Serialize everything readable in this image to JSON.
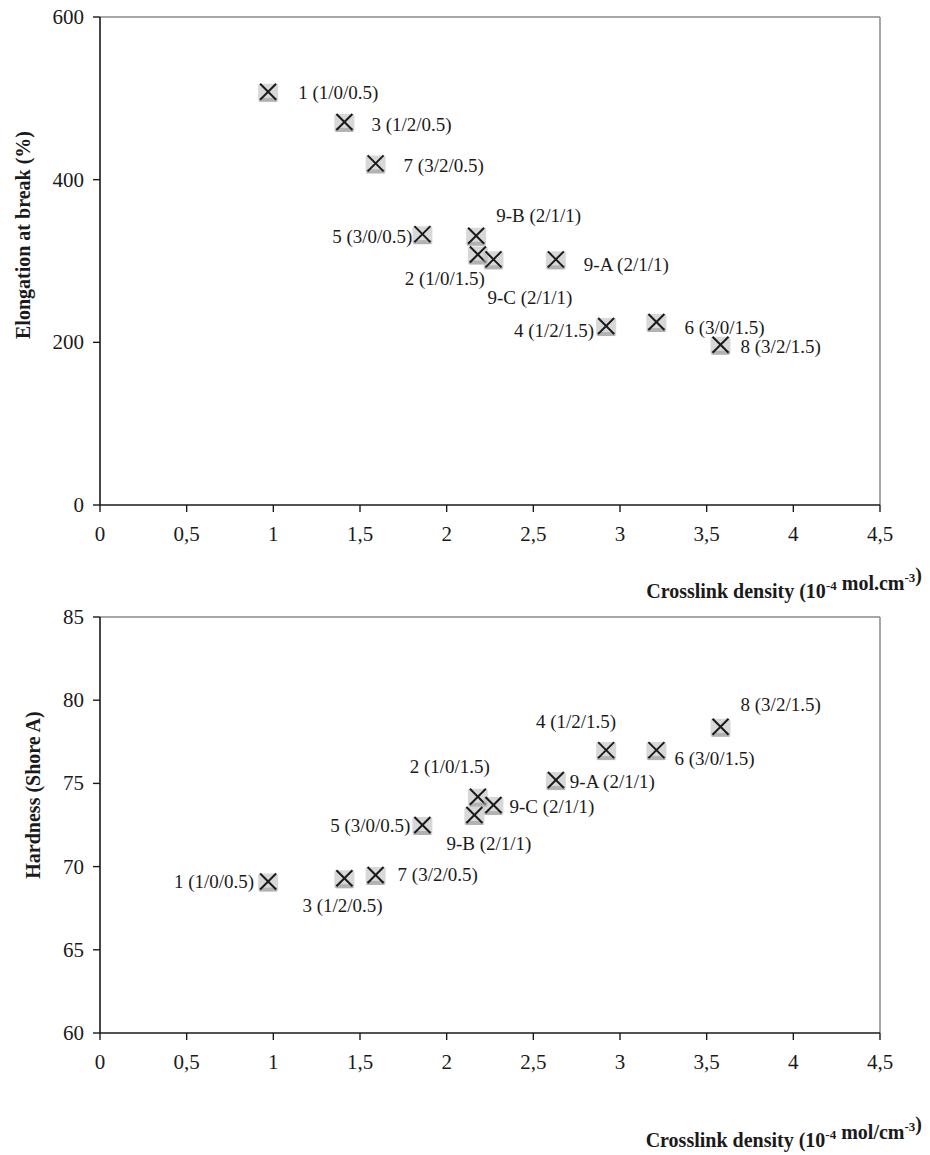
{
  "chart_data": [
    {
      "type": "scatter",
      "title": "",
      "xlabel": "Crosslink density (10-4 mol.cm-3)",
      "xlabel_parts": {
        "main": "Crosslink density (10",
        "sup1": "-4",
        "mid": " mol.cm",
        "sup2": "-3",
        "end": ")"
      },
      "ylabel": "Elongation at break (%)",
      "xlim": [
        0,
        4.5
      ],
      "ylim": [
        0,
        600
      ],
      "xticks": [
        0,
        0.5,
        1,
        1.5,
        2,
        2.5,
        3,
        3.5,
        4,
        4.5
      ],
      "xtick_labels": [
        "0",
        "0,5",
        "1",
        "1,5",
        "2",
        "2,5",
        "3",
        "3,5",
        "4",
        "4,5"
      ],
      "yticks": [
        0,
        200,
        400,
        600
      ],
      "ytick_labels": [
        "0",
        "200",
        "400",
        "600"
      ],
      "grid": false,
      "legend": null,
      "marker": "x",
      "points": [
        {
          "id": "1",
          "label": "1 (1/0/0.5)",
          "x": 0.97,
          "y": 508
        },
        {
          "id": "3",
          "label": "3 (1/2/0.5)",
          "x": 1.41,
          "y": 471
        },
        {
          "id": "7",
          "label": "7 (3/2/0.5)",
          "x": 1.59,
          "y": 420
        },
        {
          "id": "5",
          "label": "5 (3/0/0.5)",
          "x": 1.86,
          "y": 333
        },
        {
          "id": "9-B",
          "label": "9-B (2/1/1)",
          "x": 2.17,
          "y": 331
        },
        {
          "id": "2",
          "label": "2 (1/0/1.5)",
          "x": 2.18,
          "y": 308
        },
        {
          "id": "9-C",
          "label": "9-C (2/1/1)",
          "x": 2.27,
          "y": 302
        },
        {
          "id": "9-A",
          "label": "9-A  (2/1/1)",
          "x": 2.63,
          "y": 302
        },
        {
          "id": "4",
          "label": "4 (1/2/1.5)",
          "x": 2.92,
          "y": 220
        },
        {
          "id": "6",
          "label": "6 (3/0/1.5)",
          "x": 3.21,
          "y": 225
        },
        {
          "id": "8",
          "label": "8 (3/2/1.5)",
          "x": 3.58,
          "y": 197
        }
      ]
    },
    {
      "type": "scatter",
      "title": "",
      "xlabel": "Crosslink density (10-4 mol/cm-3)",
      "xlabel_parts": {
        "main": "Crosslink density (10",
        "sup1": "-4",
        "mid": " mol/cm",
        "sup2": "-3",
        "end": ")"
      },
      "ylabel": "Hardness (Shore A)",
      "xlim": [
        0,
        4.5
      ],
      "ylim": [
        60,
        85
      ],
      "xticks": [
        0,
        0.5,
        1,
        1.5,
        2,
        2.5,
        3,
        3.5,
        4,
        4.5
      ],
      "xtick_labels": [
        "0",
        "0,5",
        "1",
        "1,5",
        "2",
        "2,5",
        "3",
        "3,5",
        "4",
        "4,5"
      ],
      "yticks": [
        60,
        65,
        70,
        75,
        80,
        85
      ],
      "ytick_labels": [
        "60",
        "65",
        "70",
        "75",
        "80",
        "85"
      ],
      "grid": false,
      "legend": null,
      "marker": "x",
      "points": [
        {
          "id": "1",
          "label": "1 (1/0/0.5)",
          "x": 0.97,
          "y": 69.1
        },
        {
          "id": "3",
          "label": "3 (1/2/0.5)",
          "x": 1.41,
          "y": 69.3
        },
        {
          "id": "7",
          "label": "7 (3/2/0.5)",
          "x": 1.59,
          "y": 69.5
        },
        {
          "id": "5",
          "label": "5 (3/0/0.5)",
          "x": 1.86,
          "y": 72.5
        },
        {
          "id": "2",
          "label": "2 (1/0/1.5)",
          "x": 2.18,
          "y": 74.2
        },
        {
          "id": "9-B",
          "label": "9-B (2/1/1)",
          "x": 2.16,
          "y": 73.1
        },
        {
          "id": "9-C",
          "label": "9-C (2/1/1)",
          "x": 2.27,
          "y": 73.7
        },
        {
          "id": "9-A",
          "label": "9-A (2/1/1)",
          "x": 2.63,
          "y": 75.2
        },
        {
          "id": "4",
          "label": "4 (1/2/1.5)",
          "x": 2.92,
          "y": 77.0
        },
        {
          "id": "6",
          "label": "6 (3/0/1.5)",
          "x": 3.21,
          "y": 77.0
        },
        {
          "id": "8",
          "label": "8 (3/2/1.5)",
          "x": 3.58,
          "y": 78.4
        }
      ]
    }
  ],
  "layout": {
    "charts": [
      {
        "plot": {
          "left": 100,
          "right": 880,
          "top": 17,
          "bottom": 505
        },
        "ylabel_pos": {
          "x": 30,
          "y": 235
        },
        "xlabel_pos": {
          "x": 922,
          "y": 598
        },
        "label_offsets": {
          "1": {
            "dx": 30,
            "dy": 7,
            "anchor": "start"
          },
          "3": {
            "dx": 27,
            "dy": 9,
            "anchor": "start"
          },
          "7": {
            "dx": 28,
            "dy": 9,
            "anchor": "start"
          },
          "5": {
            "dx": -10,
            "dy": 9,
            "anchor": "end"
          },
          "9-B": {
            "dx": 20,
            "dy": -14,
            "anchor": "start"
          },
          "2": {
            "dx": 7,
            "dy": 31,
            "anchor": "end"
          },
          "9-C": {
            "dx": -6,
            "dy": 45,
            "anchor": "start"
          },
          "9-A": {
            "dx": 28,
            "dy": 12,
            "anchor": "start"
          },
          "4": {
            "dx": -12,
            "dy": 11,
            "anchor": "end"
          },
          "6": {
            "dx": 28,
            "dy": 12,
            "anchor": "start"
          },
          "8": {
            "dx": 20,
            "dy": 8,
            "anchor": "start"
          }
        }
      },
      {
        "plot": {
          "left": 100,
          "right": 880,
          "top": 617,
          "bottom": 1033
        },
        "ylabel_pos": {
          "x": 40,
          "y": 795
        },
        "xlabel_pos": {
          "x": 922,
          "y": 1147
        },
        "label_offsets": {
          "1": {
            "dx": -14,
            "dy": 6,
            "anchor": "end"
          },
          "3": {
            "dx": -42,
            "dy": 34,
            "anchor": "start"
          },
          "7": {
            "dx": 22,
            "dy": 6,
            "anchor": "start"
          },
          "5": {
            "dx": -12,
            "dy": 7,
            "anchor": "end"
          },
          "2": {
            "dx": 12,
            "dy": -24,
            "anchor": "end"
          },
          "9-B": {
            "dx": -28,
            "dy": 35,
            "anchor": "start"
          },
          "9-C": {
            "dx": 16,
            "dy": 8,
            "anchor": "start"
          },
          "9-A": {
            "dx": 14,
            "dy": 8,
            "anchor": "start"
          },
          "4": {
            "dx": 10,
            "dy": -22,
            "anchor": "end"
          },
          "6": {
            "dx": 18,
            "dy": 15,
            "anchor": "start"
          },
          "8": {
            "dx": 20,
            "dy": -16,
            "anchor": "start"
          }
        }
      }
    ]
  },
  "colors": {
    "axis": "#1a1a1a",
    "frame": "#8a8a8a",
    "marker": "#1a1a1a",
    "marker_shadow": "#b8b8b8",
    "background": "#ffffff"
  }
}
